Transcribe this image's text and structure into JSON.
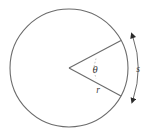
{
  "figure": {
    "background_color": "#ffffff",
    "stroke_color": "#6b6b6b",
    "label_color": "#3a3a3a",
    "labels": {
      "angle": "θ",
      "radius": "r",
      "arc": "s"
    },
    "geometry": {
      "circle_center_x": 69,
      "circle_center_y": 68,
      "circle_radius": 59,
      "sector_vertex_x": 69,
      "sector_vertex_y": 68,
      "upper_radius_end_x": 121,
      "upper_radius_end_y": 41,
      "lower_radius_end_x": 121,
      "lower_radius_end_y": 96,
      "arc_measure_top_x": 133,
      "arc_measure_top_y": 37,
      "arc_measure_bottom_x": 133,
      "arc_measure_bottom_y": 100,
      "arc_measure_bulge_x": 143,
      "angle_label_x": 95,
      "angle_label_y": 72,
      "radius_label_x": 98,
      "radius_label_y": 92,
      "arc_label_x": 138,
      "arc_label_y": 71
    }
  }
}
